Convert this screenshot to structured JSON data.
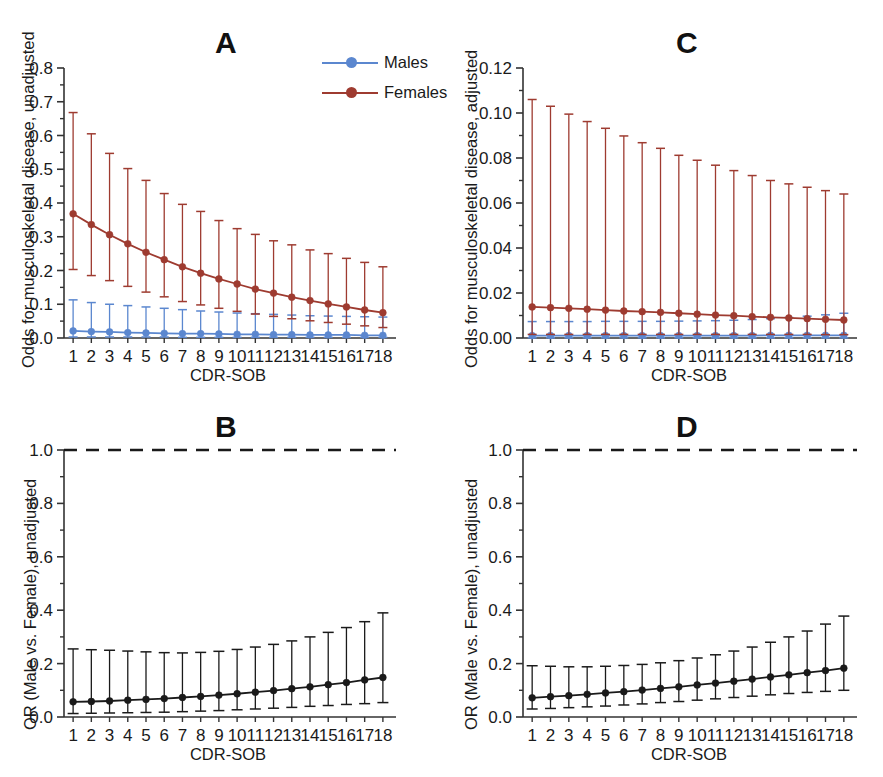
{
  "figure": {
    "panels": [
      "A",
      "B",
      "C",
      "D"
    ],
    "background": "#ffffff"
  },
  "legend": {
    "position": "top-right of panel A",
    "entries": [
      {
        "label": "Males",
        "color": "#5b87cf"
      },
      {
        "label": "Females",
        "color": "#9e3b30"
      }
    ]
  },
  "colors": {
    "males": "#5b87cf",
    "females": "#9e3b30",
    "black": "#1a1a1a",
    "axis": "#333333"
  },
  "panelA": {
    "letter": "A",
    "ylabel": "Odds for musculoskeletal disease, unadjusted",
    "xlabel": "CDR-SOB",
    "yticks": [
      "0.0",
      "0.1",
      "0.2",
      "0.3",
      "0.4",
      "0.5",
      "0.6",
      "0.7",
      "0.8"
    ],
    "xticks": [
      "1",
      "2",
      "3",
      "4",
      "5",
      "6",
      "7",
      "8",
      "9",
      "10",
      "11",
      "12",
      "13",
      "14",
      "15",
      "16",
      "17",
      "18"
    ]
  },
  "panelB": {
    "letter": "B",
    "ylabel": "OR (Male vs. Female), unadjusted",
    "xlabel": "CDR-SOB",
    "yticks": [
      "0.0",
      "0.2",
      "0.4",
      "0.6",
      "0.8",
      "1.0"
    ],
    "xticks": [
      "1",
      "2",
      "3",
      "4",
      "5",
      "6",
      "7",
      "8",
      "9",
      "10",
      "11",
      "12",
      "13",
      "14",
      "15",
      "16",
      "17",
      "18"
    ],
    "reference_line": 1.0
  },
  "panelC": {
    "letter": "C",
    "ylabel": "Odds for musculoskeletal disease, adjusted",
    "xlabel": "CDR-SOB",
    "yticks": [
      "0.00",
      "0.02",
      "0.04",
      "0.06",
      "0.08",
      "0.10",
      "0.12"
    ],
    "xticks": [
      "1",
      "2",
      "3",
      "4",
      "5",
      "6",
      "7",
      "8",
      "9",
      "10",
      "11",
      "12",
      "13",
      "14",
      "15",
      "16",
      "17",
      "18"
    ]
  },
  "panelD": {
    "letter": "D",
    "ylabel": "OR (Male vs. Female), unadjusted",
    "xlabel": "CDR-SOB",
    "yticks": [
      "0.0",
      "0.2",
      "0.4",
      "0.6",
      "0.8",
      "1.0"
    ],
    "xticks": [
      "1",
      "2",
      "3",
      "4",
      "5",
      "6",
      "7",
      "8",
      "9",
      "10",
      "11",
      "12",
      "13",
      "14",
      "15",
      "16",
      "17",
      "18"
    ],
    "reference_line": 1.0
  },
  "chart_data": [
    {
      "panel": "A",
      "type": "line",
      "title": "A",
      "xlabel": "CDR-SOB",
      "ylabel": "Odds for musculoskeletal disease, unadjusted",
      "x": [
        1,
        2,
        3,
        4,
        5,
        6,
        7,
        8,
        9,
        10,
        11,
        12,
        13,
        14,
        15,
        16,
        17,
        18
      ],
      "ylim": [
        0.0,
        0.8
      ],
      "ytick_step": 0.1,
      "grid": false,
      "legend_position": "top-right",
      "errorbars": true,
      "series": [
        {
          "name": "Males",
          "color": "#5b87cf",
          "values": [
            0.021,
            0.019,
            0.018,
            0.016,
            0.015,
            0.014,
            0.013,
            0.013,
            0.012,
            0.011,
            0.011,
            0.01,
            0.01,
            0.009,
            0.009,
            0.009,
            0.008,
            0.008
          ],
          "ci_lower": [
            0.003,
            0.003,
            0.003,
            0.003,
            0.003,
            0.003,
            0.002,
            0.002,
            0.002,
            0.002,
            0.002,
            0.002,
            0.002,
            0.002,
            0.002,
            0.002,
            0.002,
            0.002
          ],
          "ci_upper": [
            0.113,
            0.105,
            0.1,
            0.096,
            0.092,
            0.088,
            0.084,
            0.08,
            0.077,
            0.074,
            0.072,
            0.07,
            0.068,
            0.066,
            0.065,
            0.064,
            0.063,
            0.062
          ]
        },
        {
          "name": "Females",
          "color": "#9e3b30",
          "values": [
            0.368,
            0.336,
            0.306,
            0.279,
            0.254,
            0.232,
            0.211,
            0.192,
            0.175,
            0.16,
            0.145,
            0.133,
            0.121,
            0.111,
            0.101,
            0.092,
            0.083,
            0.075
          ],
          "ci_lower": [
            0.203,
            0.185,
            0.17,
            0.153,
            0.136,
            0.122,
            0.108,
            0.098,
            0.088,
            0.079,
            0.071,
            0.064,
            0.057,
            0.051,
            0.046,
            0.041,
            0.036,
            0.031
          ],
          "ci_upper": [
            0.668,
            0.605,
            0.547,
            0.502,
            0.467,
            0.428,
            0.396,
            0.375,
            0.348,
            0.324,
            0.307,
            0.288,
            0.276,
            0.261,
            0.25,
            0.236,
            0.224,
            0.211
          ]
        }
      ]
    },
    {
      "panel": "B",
      "type": "line",
      "title": "B",
      "xlabel": "CDR-SOB",
      "ylabel": "OR (Male vs. Female), unadjusted",
      "x": [
        1,
        2,
        3,
        4,
        5,
        6,
        7,
        8,
        9,
        10,
        11,
        12,
        13,
        14,
        15,
        16,
        17,
        18
      ],
      "ylim": [
        0.0,
        1.0
      ],
      "ytick_step": 0.2,
      "grid": false,
      "errorbars": true,
      "reference_line": {
        "y": 1.0,
        "style": "dashed",
        "color": "#1a1a1a"
      },
      "series": [
        {
          "name": "OR (Male vs. Female)",
          "color": "#1a1a1a",
          "values": [
            0.057,
            0.058,
            0.06,
            0.063,
            0.066,
            0.069,
            0.073,
            0.077,
            0.082,
            0.087,
            0.093,
            0.099,
            0.106,
            0.113,
            0.121,
            0.129,
            0.139,
            0.148
          ],
          "ci_lower": [
            0.013,
            0.014,
            0.015,
            0.016,
            0.017,
            0.018,
            0.02,
            0.022,
            0.024,
            0.027,
            0.03,
            0.033,
            0.036,
            0.04,
            0.043,
            0.047,
            0.05,
            0.054
          ],
          "ci_upper": [
            0.255,
            0.252,
            0.25,
            0.247,
            0.244,
            0.241,
            0.24,
            0.242,
            0.246,
            0.253,
            0.262,
            0.272,
            0.285,
            0.3,
            0.317,
            0.335,
            0.357,
            0.39
          ]
        }
      ]
    },
    {
      "panel": "C",
      "type": "line",
      "title": "C",
      "xlabel": "CDR-SOB",
      "ylabel": "Odds for musculoskeletal disease, adjusted",
      "x": [
        1,
        2,
        3,
        4,
        5,
        6,
        7,
        8,
        9,
        10,
        11,
        12,
        13,
        14,
        15,
        16,
        17,
        18
      ],
      "ylim": [
        0.0,
        0.12
      ],
      "ytick_step": 0.02,
      "grid": false,
      "errorbars": true,
      "series": [
        {
          "name": "Males",
          "color": "#5b87cf",
          "values": [
            0.0011,
            0.0011,
            0.0011,
            0.0011,
            0.0011,
            0.0011,
            0.0011,
            0.0011,
            0.0011,
            0.0011,
            0.0011,
            0.0011,
            0.0011,
            0.0012,
            0.0012,
            0.0012,
            0.0012,
            0.0012
          ],
          "ci_lower": [
            0.0001,
            0.0001,
            0.0001,
            0.0001,
            0.0001,
            0.0001,
            0.0001,
            0.0001,
            0.0001,
            0.0001,
            0.0001,
            0.0001,
            0.0001,
            0.0001,
            0.0001,
            0.0001,
            0.0001,
            0.0001
          ],
          "ci_upper": [
            0.0073,
            0.0073,
            0.0073,
            0.0073,
            0.0074,
            0.0074,
            0.0074,
            0.0074,
            0.0075,
            0.0076,
            0.0077,
            0.0079,
            0.0082,
            0.0086,
            0.0091,
            0.0097,
            0.0103,
            0.011
          ]
        },
        {
          "name": "Females",
          "color": "#9e3b30",
          "values": [
            0.0138,
            0.0135,
            0.0132,
            0.0128,
            0.0124,
            0.012,
            0.0117,
            0.0114,
            0.011,
            0.0106,
            0.0102,
            0.0099,
            0.0095,
            0.0092,
            0.0089,
            0.0086,
            0.0083,
            0.008
          ],
          "ci_lower": [
            0.0016,
            0.0016,
            0.0016,
            0.0016,
            0.0016,
            0.0016,
            0.0016,
            0.0016,
            0.0016,
            0.0016,
            0.0016,
            0.0016,
            0.0016,
            0.0016,
            0.0016,
            0.0016,
            0.0015,
            0.0015
          ],
          "ci_upper": [
            0.106,
            0.103,
            0.0995,
            0.0962,
            0.0932,
            0.0898,
            0.0868,
            0.0843,
            0.0812,
            0.079,
            0.0768,
            0.0744,
            0.0722,
            0.07,
            0.0685,
            0.067,
            0.0655,
            0.064
          ]
        }
      ]
    },
    {
      "panel": "D",
      "type": "line",
      "title": "D",
      "xlabel": "CDR-SOB",
      "ylabel": "OR (Male vs. Female), unadjusted",
      "x": [
        1,
        2,
        3,
        4,
        5,
        6,
        7,
        8,
        9,
        10,
        11,
        12,
        13,
        14,
        15,
        16,
        17,
        18
      ],
      "ylim": [
        0.0,
        1.0
      ],
      "ytick_step": 0.2,
      "grid": false,
      "errorbars": true,
      "reference_line": {
        "y": 1.0,
        "style": "dashed",
        "color": "#1a1a1a"
      },
      "series": [
        {
          "name": "OR (Male vs. Female)",
          "color": "#1a1a1a",
          "values": [
            0.072,
            0.076,
            0.08,
            0.085,
            0.09,
            0.095,
            0.101,
            0.107,
            0.113,
            0.12,
            0.127,
            0.134,
            0.142,
            0.15,
            0.158,
            0.166,
            0.174,
            0.183
          ],
          "ci_lower": [
            0.03,
            0.032,
            0.035,
            0.038,
            0.041,
            0.045,
            0.049,
            0.054,
            0.058,
            0.063,
            0.068,
            0.073,
            0.078,
            0.083,
            0.088,
            0.092,
            0.096,
            0.1
          ],
          "ci_upper": [
            0.192,
            0.19,
            0.188,
            0.188,
            0.19,
            0.193,
            0.197,
            0.203,
            0.211,
            0.221,
            0.233,
            0.247,
            0.262,
            0.28,
            0.3,
            0.322,
            0.348,
            0.378
          ]
        }
      ]
    }
  ]
}
